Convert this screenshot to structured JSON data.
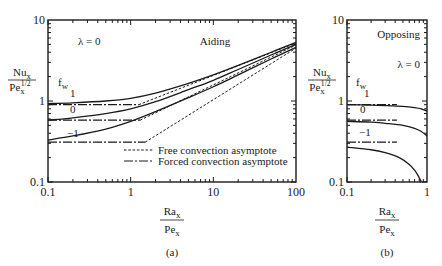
{
  "chart_data": [
    {
      "id": "a",
      "type": "line",
      "panel_label": "(a)",
      "title": "Aiding",
      "annotation": "λ = 0",
      "xlabel_num": "Ra",
      "xlabel_num_sub": "x",
      "xlabel_den": "Pe",
      "xlabel_den_sub": "x",
      "ylabel_num": "Nu",
      "ylabel_num_sub": "x",
      "ylabel_den": "Pe",
      "ylabel_den_sub": "x",
      "ylabel_den_sup": "1/2",
      "xscale": "log",
      "yscale": "log",
      "xlim": [
        0.1,
        100
      ],
      "ylim": [
        0.1,
        10
      ],
      "xticks": [
        {
          "v": 0.1,
          "label": "0.1"
        },
        {
          "v": 1,
          "label": "1"
        },
        {
          "v": 10,
          "label": "10"
        },
        {
          "v": 100,
          "label": "100"
        }
      ],
      "yticks": [
        {
          "v": 0.1,
          "label": "0.1"
        },
        {
          "v": 1,
          "label": "1"
        },
        {
          "v": 10,
          "label": "10"
        }
      ],
      "param_label": "f",
      "param_sub": "w",
      "legend": {
        "placement": "bottom-right",
        "entries": [
          {
            "style": "dashed",
            "label": "Free convection asymptote"
          },
          {
            "style": "dashdot",
            "label": "Forced convection asymptote"
          }
        ]
      },
      "series": [
        {
          "name": "f_w = 1",
          "label": "1",
          "style": "solid",
          "x": [
            0.1,
            0.2,
            0.5,
            1,
            2,
            5,
            10,
            20,
            50,
            100
          ],
          "y": [
            0.93,
            0.95,
            1.0,
            1.08,
            1.25,
            1.65,
            2.1,
            2.75,
            4.0,
            5.3
          ]
        },
        {
          "name": "f_w = 0",
          "label": "0",
          "style": "solid",
          "x": [
            0.1,
            0.2,
            0.5,
            1,
            2,
            5,
            10,
            20,
            50,
            100
          ],
          "y": [
            0.58,
            0.62,
            0.7,
            0.8,
            0.98,
            1.38,
            1.8,
            2.45,
            3.7,
            5.0
          ]
        },
        {
          "name": "f_w = -1",
          "label": "-1",
          "style": "solid",
          "x": [
            0.1,
            0.2,
            0.5,
            1,
            2,
            5,
            10,
            20,
            50,
            100
          ],
          "y": [
            0.33,
            0.37,
            0.45,
            0.56,
            0.74,
            1.1,
            1.5,
            2.1,
            3.3,
            4.6
          ]
        },
        {
          "name": "Forced asymptote f_w = 1",
          "style": "dashdot",
          "x": [
            0.1,
            1.25
          ],
          "y": [
            0.9,
            0.9
          ]
        },
        {
          "name": "Forced asymptote f_w = 0",
          "style": "dashdot",
          "x": [
            0.1,
            1.3
          ],
          "y": [
            0.58,
            0.58
          ]
        },
        {
          "name": "Forced asymptote f_w = -1",
          "style": "dashdot",
          "x": [
            0.1,
            1.5
          ],
          "y": [
            0.31,
            0.31
          ]
        },
        {
          "name": "Free asymptote f_w = 1",
          "style": "dashed",
          "x": [
            1.25,
            100
          ],
          "y": [
            0.9,
            5.2
          ]
        },
        {
          "name": "Free asymptote f_w = 0",
          "style": "dashed",
          "x": [
            1.3,
            100
          ],
          "y": [
            0.58,
            4.9
          ]
        },
        {
          "name": "Free asymptote f_w = -1",
          "style": "dashed",
          "x": [
            1.5,
            100
          ],
          "y": [
            0.31,
            4.5
          ]
        }
      ]
    },
    {
      "id": "b",
      "type": "line",
      "panel_label": "(b)",
      "title": "Opposing",
      "annotation": "λ = 0",
      "xlabel_num": "Ra",
      "xlabel_num_sub": "x",
      "xlabel_den": "Pe",
      "xlabel_den_sub": "x",
      "ylabel_num": "Nu",
      "ylabel_num_sub": "x",
      "ylabel_den": "Pe",
      "ylabel_den_sub": "x",
      "ylabel_den_sup": "1/2",
      "xscale": "log",
      "yscale": "log",
      "xlim": [
        0.1,
        1
      ],
      "ylim": [
        0.1,
        10
      ],
      "xticks": [
        {
          "v": 0.1,
          "label": "0.1"
        },
        {
          "v": 1,
          "label": "1"
        }
      ],
      "yticks": [
        {
          "v": 0.1,
          "label": "0.1"
        },
        {
          "v": 1,
          "label": "1"
        },
        {
          "v": 10,
          "label": "10"
        }
      ],
      "param_label": "f",
      "param_sub": "w",
      "series": [
        {
          "name": "f_w = 1",
          "label": "1",
          "style": "solid",
          "x": [
            0.1,
            0.2,
            0.3,
            0.5,
            0.7,
            0.85,
            1.0
          ],
          "y": [
            0.9,
            0.89,
            0.88,
            0.86,
            0.83,
            0.8,
            0.75
          ]
        },
        {
          "name": "f_w = 0",
          "label": "0",
          "style": "solid",
          "x": [
            0.1,
            0.2,
            0.3,
            0.5,
            0.7,
            0.85,
            1.0
          ],
          "y": [
            0.56,
            0.55,
            0.53,
            0.5,
            0.46,
            0.42,
            0.37
          ]
        },
        {
          "name": "f_w = -1",
          "label": "-1",
          "style": "solid",
          "x": [
            0.1,
            0.2,
            0.3,
            0.45,
            0.6,
            0.7,
            0.78,
            0.85
          ],
          "y": [
            0.27,
            0.25,
            0.23,
            0.2,
            0.165,
            0.14,
            0.118,
            0.1
          ]
        },
        {
          "name": "Forced asymptote f_w = 1",
          "style": "dashdot",
          "x": [
            0.1,
            0.42
          ],
          "y": [
            0.9,
            0.9
          ]
        },
        {
          "name": "Forced asymptote f_w = 0",
          "style": "dashdot",
          "x": [
            0.1,
            0.42
          ],
          "y": [
            0.58,
            0.58
          ]
        },
        {
          "name": "Forced asymptote f_w = -1",
          "style": "dashdot",
          "x": [
            0.1,
            0.42
          ],
          "y": [
            0.31,
            0.31
          ]
        }
      ]
    }
  ]
}
